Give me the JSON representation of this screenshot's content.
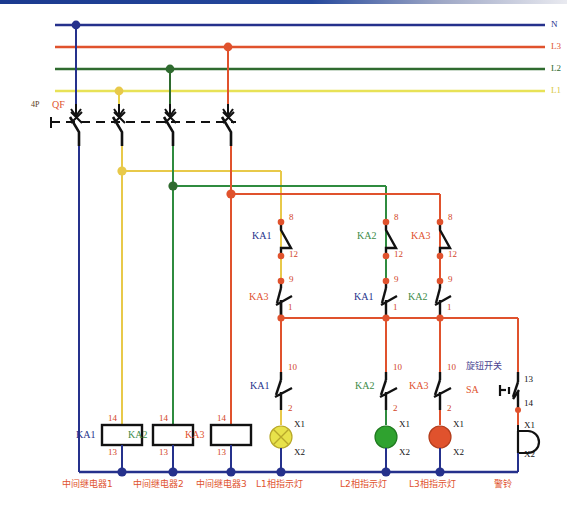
{
  "diagram": {
    "type": "electrical-schematic"
  },
  "bus_labels": [
    {
      "id": "N",
      "text": "N",
      "color": "#25318c",
      "y": 25
    },
    {
      "id": "L3",
      "text": "L3",
      "color": "#e0522d",
      "y": 47
    },
    {
      "id": "L2",
      "text": "L2",
      "color": "#2f6b2f",
      "y": 69
    },
    {
      "id": "L1",
      "text": "L1",
      "color": "#e8e257",
      "y": 91
    }
  ],
  "breaker": {
    "poles_label": "4P",
    "poles_color": "#5a3a1a",
    "name": "QF",
    "name_color": "#e0522d"
  },
  "upper_contacts": [
    {
      "top_terminal": "8",
      "nc_device": "KA1",
      "nc_color": "#25318c",
      "mid_terminal": "12",
      "no_terminal": "9",
      "no_device": "KA3",
      "no_color": "#e0522d",
      "bottom_terminal": "1"
    },
    {
      "top_terminal": "8",
      "nc_device": "KA2",
      "nc_color": "#3d8b47",
      "mid_terminal": "12",
      "no_terminal": "9",
      "no_device": "KA1",
      "no_color": "#25318c",
      "bottom_terminal": "1"
    },
    {
      "top_terminal": "8",
      "nc_device": "KA3",
      "nc_color": "#e0522d",
      "mid_terminal": "12",
      "no_terminal": "9",
      "no_device": "KA2",
      "no_color": "#3d8b47",
      "bottom_terminal": "1"
    }
  ],
  "lamp_contacts": [
    {
      "top_terminal": "10",
      "device": "KA1",
      "device_color": "#25318c",
      "bottom_terminal": "2"
    },
    {
      "top_terminal": "10",
      "device": "KA2",
      "device_color": "#3d8b47",
      "bottom_terminal": "2"
    },
    {
      "top_terminal": "10",
      "device": "KA3",
      "device_color": "#e0522d",
      "bottom_terminal": "2"
    }
  ],
  "lamps": [
    {
      "name": "L1-indicator-lamp",
      "color": "#e8e24a",
      "x1": "X1",
      "x2": "X2",
      "caption": "L1相指示灯"
    },
    {
      "name": "L2-indicator-lamp",
      "color": "#2fa22f",
      "x1": "X1",
      "x2": "X2",
      "caption": "L2相指示灯"
    },
    {
      "name": "L3-indicator-lamp",
      "color": "#e0522d",
      "x1": "X1",
      "x2": "X2",
      "caption": "L3相指示灯"
    }
  ],
  "coils": [
    {
      "device": "KA1",
      "device_color": "#25318c",
      "top_terminal": "14",
      "bottom_terminal": "13",
      "caption": "中间继电器1"
    },
    {
      "device": "KA2",
      "device_color": "#3d8b47",
      "top_terminal": "14",
      "bottom_terminal": "13",
      "caption": "中间继电器2"
    },
    {
      "device": "KA3",
      "device_color": "#e0522d",
      "top_terminal": "14",
      "bottom_terminal": "13",
      "caption": "中间继电器3"
    }
  ],
  "rotary_switch": {
    "caption": "旋钮开关",
    "caption_color": "#4a3f8f",
    "name": "SA",
    "name_color": "#e0522d",
    "top_terminal": "13",
    "bottom_terminal": "14"
  },
  "bell": {
    "x1": "X1",
    "x2": "X2",
    "caption": "警铃"
  },
  "colors": {
    "N": "#25318c",
    "L1": "#e8d24a",
    "L2": "#2f6b2f",
    "L3": "#e0522d",
    "wire_black": "#111111",
    "terminal_dot": "#e0522d"
  }
}
